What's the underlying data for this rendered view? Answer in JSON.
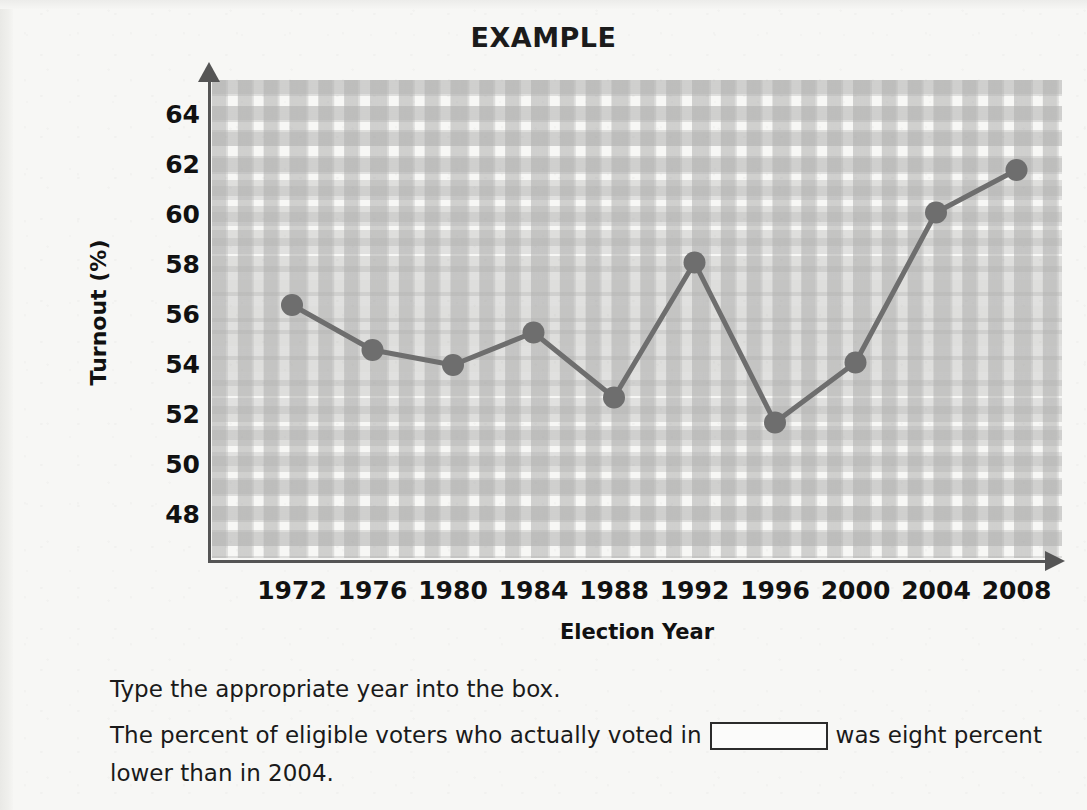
{
  "chart_data": {
    "type": "line",
    "title": "EXAMPLE",
    "xlabel": "Election Year",
    "ylabel": "Turnout (%)",
    "categories": [
      "1972",
      "1976",
      "1980",
      "1984",
      "1988",
      "1992",
      "1996",
      "2000",
      "2004",
      "2008"
    ],
    "values": [
      56.4,
      54.6,
      54.0,
      55.3,
      52.7,
      58.1,
      51.7,
      54.1,
      60.1,
      61.8
    ],
    "ylim": [
      47,
      65
    ],
    "yticks": [
      "64",
      "62",
      "60",
      "58",
      "56",
      "54",
      "52",
      "50",
      "48"
    ],
    "ytick_values": [
      64,
      62,
      60,
      58,
      56,
      54,
      52,
      50,
      48
    ],
    "grid": true,
    "legend": "none",
    "series_color": "#6e6e6e",
    "axis_color": "#555555",
    "marker": "circle"
  },
  "question": {
    "instruction": "Type the appropriate year into the box.",
    "prompt_before": "The percent of eligible voters who actually voted in",
    "prompt_after": "was eight percent lower than in 2004.",
    "answer_value": "",
    "answer_placeholder": ""
  }
}
